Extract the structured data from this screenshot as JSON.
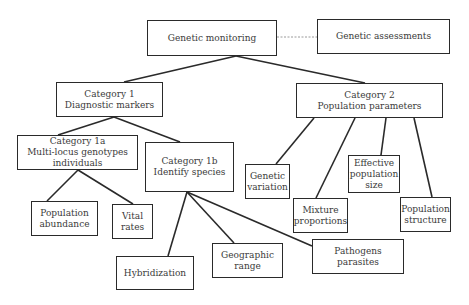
{
  "diagram": {
    "type": "hierarchy",
    "nodes": {
      "genetic_monitoring": {
        "lines": [
          "Genetic monitoring"
        ]
      },
      "genetic_assessments": {
        "lines": [
          "Genetic assessments"
        ]
      },
      "category1": {
        "lines": [
          "Category 1",
          "Diagnostic markers"
        ]
      },
      "category2": {
        "lines": [
          "Category 2",
          "Population parameters"
        ]
      },
      "category1a": {
        "lines": [
          "Category 1a",
          "Multi-locus genotypes",
          "individuals"
        ]
      },
      "category1b": {
        "lines": [
          "Category 1b",
          "Identify species"
        ]
      },
      "population_abundance": {
        "lines": [
          "Population",
          "abundance"
        ]
      },
      "vital_rates": {
        "lines": [
          "Vital",
          "rates"
        ]
      },
      "hybridization": {
        "lines": [
          "Hybridization"
        ]
      },
      "geographic_range": {
        "lines": [
          "Geographic",
          "range"
        ]
      },
      "pathogens_parasites": {
        "lines": [
          "Pathogens",
          "parasites"
        ]
      },
      "genetic_variation": {
        "lines": [
          "Genetic",
          "variation"
        ]
      },
      "mixture_proportions": {
        "lines": [
          "Mixture",
          "proportions"
        ]
      },
      "effective_population_size": {
        "lines": [
          "Effective",
          "population",
          "size"
        ]
      },
      "population_structure": {
        "lines": [
          "Population",
          "structure"
        ]
      }
    },
    "edges": [
      {
        "from": "genetic_monitoring",
        "to": "genetic_assessments",
        "style": "dashed"
      },
      {
        "from": "genetic_monitoring",
        "to": "category1",
        "style": "solid"
      },
      {
        "from": "genetic_monitoring",
        "to": "category2",
        "style": "solid"
      },
      {
        "from": "category1",
        "to": "category1a",
        "style": "solid"
      },
      {
        "from": "category1",
        "to": "category1b",
        "style": "solid"
      },
      {
        "from": "category1a",
        "to": "population_abundance",
        "style": "solid"
      },
      {
        "from": "category1a",
        "to": "vital_rates",
        "style": "solid"
      },
      {
        "from": "category1b",
        "to": "hybridization",
        "style": "solid"
      },
      {
        "from": "category1b",
        "to": "geographic_range",
        "style": "solid"
      },
      {
        "from": "category1b",
        "to": "pathogens_parasites",
        "style": "solid"
      },
      {
        "from": "category2",
        "to": "genetic_variation",
        "style": "solid"
      },
      {
        "from": "category2",
        "to": "mixture_proportions",
        "style": "solid"
      },
      {
        "from": "category2",
        "to": "effective_population_size",
        "style": "solid"
      },
      {
        "from": "category2",
        "to": "population_structure",
        "style": "solid"
      }
    ],
    "colors": {
      "line": "#2a2a2a",
      "dashed_line": "#9a9a9a",
      "text": "#3a3a3a",
      "background": "#ffffff"
    }
  }
}
